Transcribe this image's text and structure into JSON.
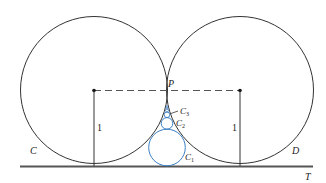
{
  "figure": {
    "labels": {
      "C": "C",
      "D": "D",
      "P": "P",
      "T": "T",
      "C1": "C",
      "C1_sub": "1",
      "C2": "C",
      "C2_sub": "2",
      "C3": "C",
      "C3_sub": "3",
      "radius_left": "1",
      "radius_right": "1"
    },
    "colors": {
      "stroke": "#333333",
      "blue": "#3b7fc4",
      "line": "#555555"
    }
  }
}
